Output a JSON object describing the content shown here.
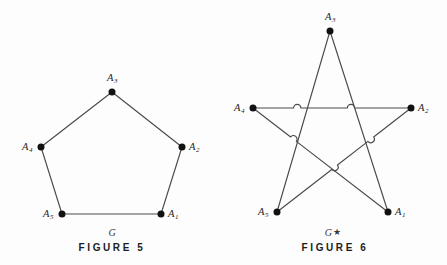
{
  "page": {
    "background_color": "#fdfdfd",
    "line_color": "#4a4a4a",
    "node_color": "#111111",
    "text_color": "#262626",
    "width": 447,
    "height": 265
  },
  "figures": [
    {
      "id": "figure-5",
      "caption": "FIGURE 5",
      "graph_name": "G",
      "graph_name_star": "",
      "graph_type": "pentagon-cycle",
      "caption_x": 112,
      "caption_y": 243,
      "name_x": 112,
      "name_y": 228,
      "nodes": [
        {
          "id": "A1",
          "label": "A",
          "sub": "1",
          "x": 161,
          "y": 214,
          "label_dx": 7,
          "label_dy": -5
        },
        {
          "id": "A2",
          "label": "A",
          "sub": "2",
          "x": 182,
          "y": 147,
          "label_dx": 7,
          "label_dy": -5
        },
        {
          "id": "A3",
          "label": "A",
          "sub": "3",
          "x": 112,
          "y": 92,
          "label_dx": -5,
          "label_dy": -19
        },
        {
          "id": "A4",
          "label": "A",
          "sub": "4",
          "x": 41,
          "y": 147,
          "label_dx": -19,
          "label_dy": -5
        },
        {
          "id": "A5",
          "label": "A",
          "sub": "5",
          "x": 62,
          "y": 214,
          "label_dx": -19,
          "label_dy": -5
        }
      ],
      "edges": [
        {
          "from": "A1",
          "to": "A2",
          "hops": []
        },
        {
          "from": "A2",
          "to": "A3",
          "hops": []
        },
        {
          "from": "A3",
          "to": "A4",
          "hops": []
        },
        {
          "from": "A4",
          "to": "A5",
          "hops": []
        },
        {
          "from": "A5",
          "to": "A1",
          "hops": []
        }
      ]
    },
    {
      "id": "figure-6",
      "caption": "FIGURE 6",
      "graph_name": "G",
      "graph_name_star": "★",
      "graph_type": "pentagram-star",
      "caption_x": 335,
      "caption_y": 243,
      "name_x": 333,
      "name_y": 228,
      "nodes": [
        {
          "id": "A1",
          "label": "A",
          "sub": "1",
          "x": 388,
          "y": 212,
          "label_dx": 7,
          "label_dy": -5
        },
        {
          "id": "A2",
          "label": "A",
          "sub": "2",
          "x": 411,
          "y": 108,
          "label_dx": 7,
          "label_dy": -5
        },
        {
          "id": "A3",
          "label": "A",
          "sub": "3",
          "x": 330,
          "y": 31,
          "label_dx": -5,
          "label_dy": -19
        },
        {
          "id": "A4",
          "label": "A",
          "sub": "4",
          "x": 253,
          "y": 108,
          "label_dx": -19,
          "label_dy": -5
        },
        {
          "id": "A5",
          "label": "A",
          "sub": "5",
          "x": 277,
          "y": 212,
          "label_dx": -19,
          "label_dy": -5
        }
      ],
      "edges": [
        {
          "from": "A4",
          "to": "A2",
          "hops": [
            0.28,
            0.62
          ]
        },
        {
          "from": "A3",
          "to": "A5",
          "hops": []
        },
        {
          "from": "A3",
          "to": "A1",
          "hops": []
        },
        {
          "from": "A4",
          "to": "A1",
          "hops": [
            0.3
          ]
        },
        {
          "from": "A2",
          "to": "A5",
          "hops": [
            0.3,
            0.57
          ]
        }
      ]
    }
  ]
}
